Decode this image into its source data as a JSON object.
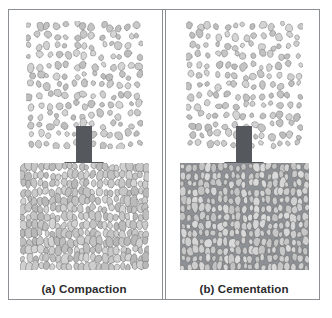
{
  "figure": {
    "frame_color": "#8b8f93",
    "background": "#ffffff",
    "partial_caption": ""
  },
  "panels": [
    {
      "id": "compaction",
      "label": "(a) Compaction",
      "letter": "(a)",
      "process": "Compaction",
      "top_block": {
        "name": "loose-sediment-grains",
        "description": "Loose, uncompacted sediment grains with open pore space",
        "grain_fill": "#c9c9c9",
        "grain_stroke": "#7c7c7c",
        "pore_fill": "#ffffff",
        "grain_count": 150
      },
      "arrow": {
        "name": "downward-process-arrow",
        "direction": "down",
        "color": "#55595d"
      },
      "bottom_block": {
        "name": "compacted-sediment",
        "description": "Grains pressed tightly together, pore space reduced",
        "grain_fill": "#c4c4c4",
        "grain_stroke": "#6f6f6f",
        "pore_fill": "#ffffff",
        "grain_count": 300
      }
    },
    {
      "id": "cementation",
      "label": "(b) Cementation",
      "letter": "(b)",
      "process": "Cementation",
      "top_block": {
        "name": "loose-sediment-grains",
        "description": "Loose, uncompacted sediment grains with open pore space",
        "grain_fill": "#c9c9c9",
        "grain_stroke": "#7c7c7c",
        "pore_fill": "#ffffff",
        "grain_count": 150
      },
      "arrow": {
        "name": "downward-process-arrow",
        "direction": "down",
        "color": "#55595d"
      },
      "bottom_block": {
        "name": "cemented-sediment",
        "description": "Grains bound together by cement filling the pore space",
        "grain_fill": "#cfcfcf",
        "grain_stroke": "#6f6f6f",
        "pore_fill": "#8d9094",
        "grain_count": 300
      }
    }
  ]
}
